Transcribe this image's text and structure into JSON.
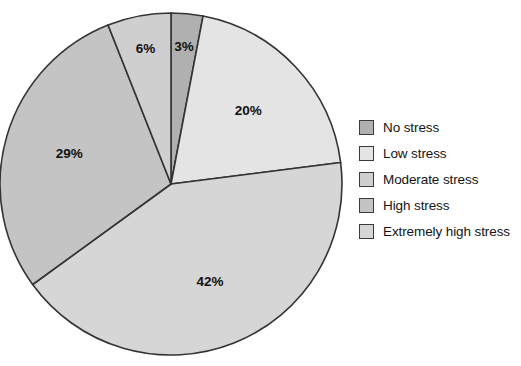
{
  "chart_data": {
    "type": "pie",
    "title": "",
    "categories": [
      "No stress",
      "Low stress",
      "Moderate stress",
      "High stress",
      "Extremely high stress"
    ],
    "values": [
      3,
      20,
      42,
      29,
      6
    ],
    "value_labels": [
      "3%",
      "20%",
      "42%",
      "29%",
      "6%"
    ],
    "unit": "%",
    "total": 100,
    "start_angle_deg": 0,
    "direction": "clockwise",
    "legend_position": "right",
    "grid": false,
    "slice_colors": [
      "#b0b0b0",
      "#e4e4e4",
      "#d6d6d6",
      "#c4c4c4",
      "#cfcfcf"
    ],
    "outline_color": "#333333",
    "background": "#ffffff",
    "slices": [
      {
        "label": "No stress",
        "value": 3,
        "display": "3%",
        "color": "#b0b0b0",
        "draw_order": 1
      },
      {
        "label": "Low stress",
        "value": 20,
        "display": "20%",
        "color": "#e4e4e4",
        "draw_order": 2
      },
      {
        "label": "Extremely high stress",
        "value": 42,
        "display": "42%",
        "color": "#d6d6d6",
        "draw_order": 3
      },
      {
        "label": "High stress",
        "value": 29,
        "display": "29%",
        "color": "#c4c4c4",
        "draw_order": 4
      },
      {
        "label": "Moderate stress",
        "value": 6,
        "display": "6%",
        "color": "#cfcfcf",
        "draw_order": 5
      }
    ]
  },
  "legend": {
    "items": [
      {
        "label": "No stress",
        "color": "#b0b0b0"
      },
      {
        "label": "Low stress",
        "color": "#e4e4e4"
      },
      {
        "label": "Moderate stress",
        "color": "#cfcfcf"
      },
      {
        "label": "High stress",
        "color": "#c4c4c4"
      },
      {
        "label": "Extremely high stress",
        "color": "#d6d6d6"
      }
    ]
  },
  "geometry": {
    "center_x": 171,
    "center_y": 184,
    "radius": 171,
    "label_radius_factor": 0.62
  }
}
